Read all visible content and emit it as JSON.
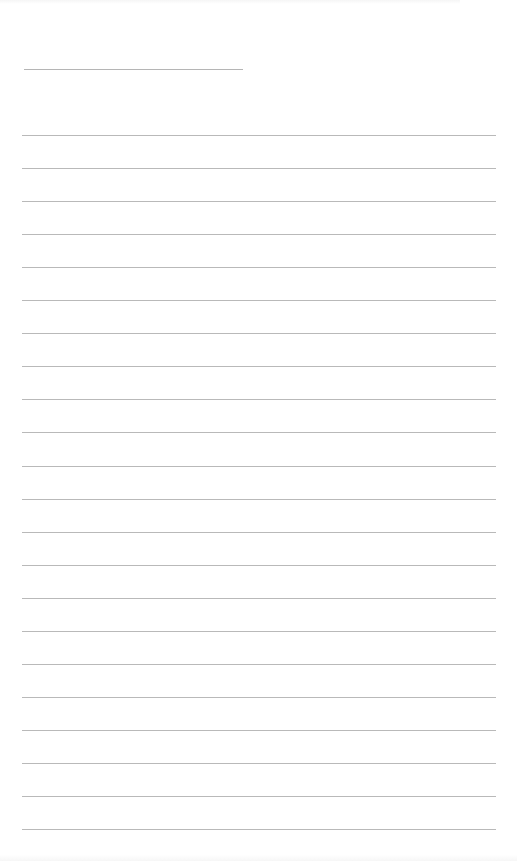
{
  "page": {
    "type": "lined-writing-paper",
    "background_color": "#ffffff",
    "line_color": "#b9b9b9"
  },
  "header": {
    "name_line": {
      "label": "",
      "value": ""
    }
  },
  "ruled_lines": {
    "count": 22,
    "first_line_y": 135,
    "spacing_px": 33.05,
    "values": [
      "",
      "",
      "",
      "",
      "",
      "",
      "",
      "",
      "",
      "",
      "",
      "",
      "",
      "",
      "",
      "",
      "",
      "",
      "",
      "",
      "",
      ""
    ]
  }
}
